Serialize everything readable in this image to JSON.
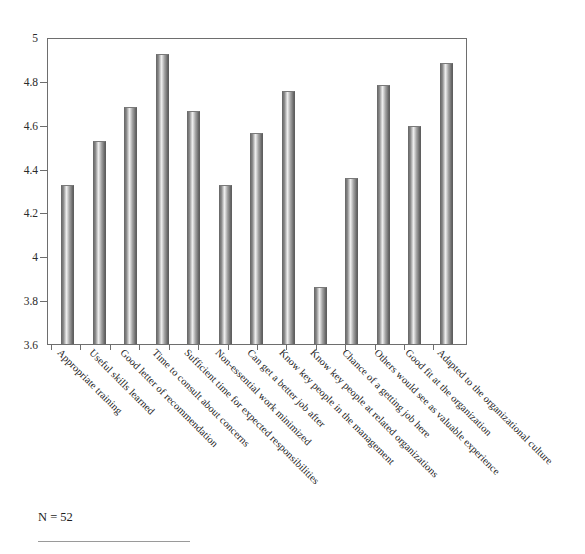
{
  "chart_data": {
    "type": "bar",
    "title": "",
    "subtitle": "",
    "xlabel": "",
    "ylabel": "",
    "ylim": [
      3.6,
      5
    ],
    "yticks": [
      "3.6",
      "3.8",
      "4",
      "4.2",
      "4.4",
      "4.6",
      "4.8",
      "5"
    ],
    "ytick_values": [
      3.6,
      3.8,
      4.0,
      4.2,
      4.4,
      4.6,
      4.8,
      5.0
    ],
    "grid": false,
    "legend": false,
    "categories": [
      "Appropriate training",
      "Useful skills learned",
      "Good letter of recommendation",
      "Time to consult about concerns",
      "Sufficient time for expected responsibilities",
      "Non-essential work minimized",
      "Can get a better job after",
      "Know key people in the management",
      "Know key people at related organizations",
      "Chance of a getting job here",
      "Others would see as valuable experience",
      "Good fit at the organization",
      "Adapted to the organizational culture"
    ],
    "values": [
      4.33,
      4.53,
      4.69,
      4.93,
      4.67,
      4.33,
      4.57,
      4.76,
      3.86,
      4.36,
      4.79,
      4.6,
      4.89
    ],
    "bar_color": "#9a9a9a",
    "bar_style": "cylinder-gradient"
  },
  "annotations": {
    "sample_size": "N = 52"
  }
}
